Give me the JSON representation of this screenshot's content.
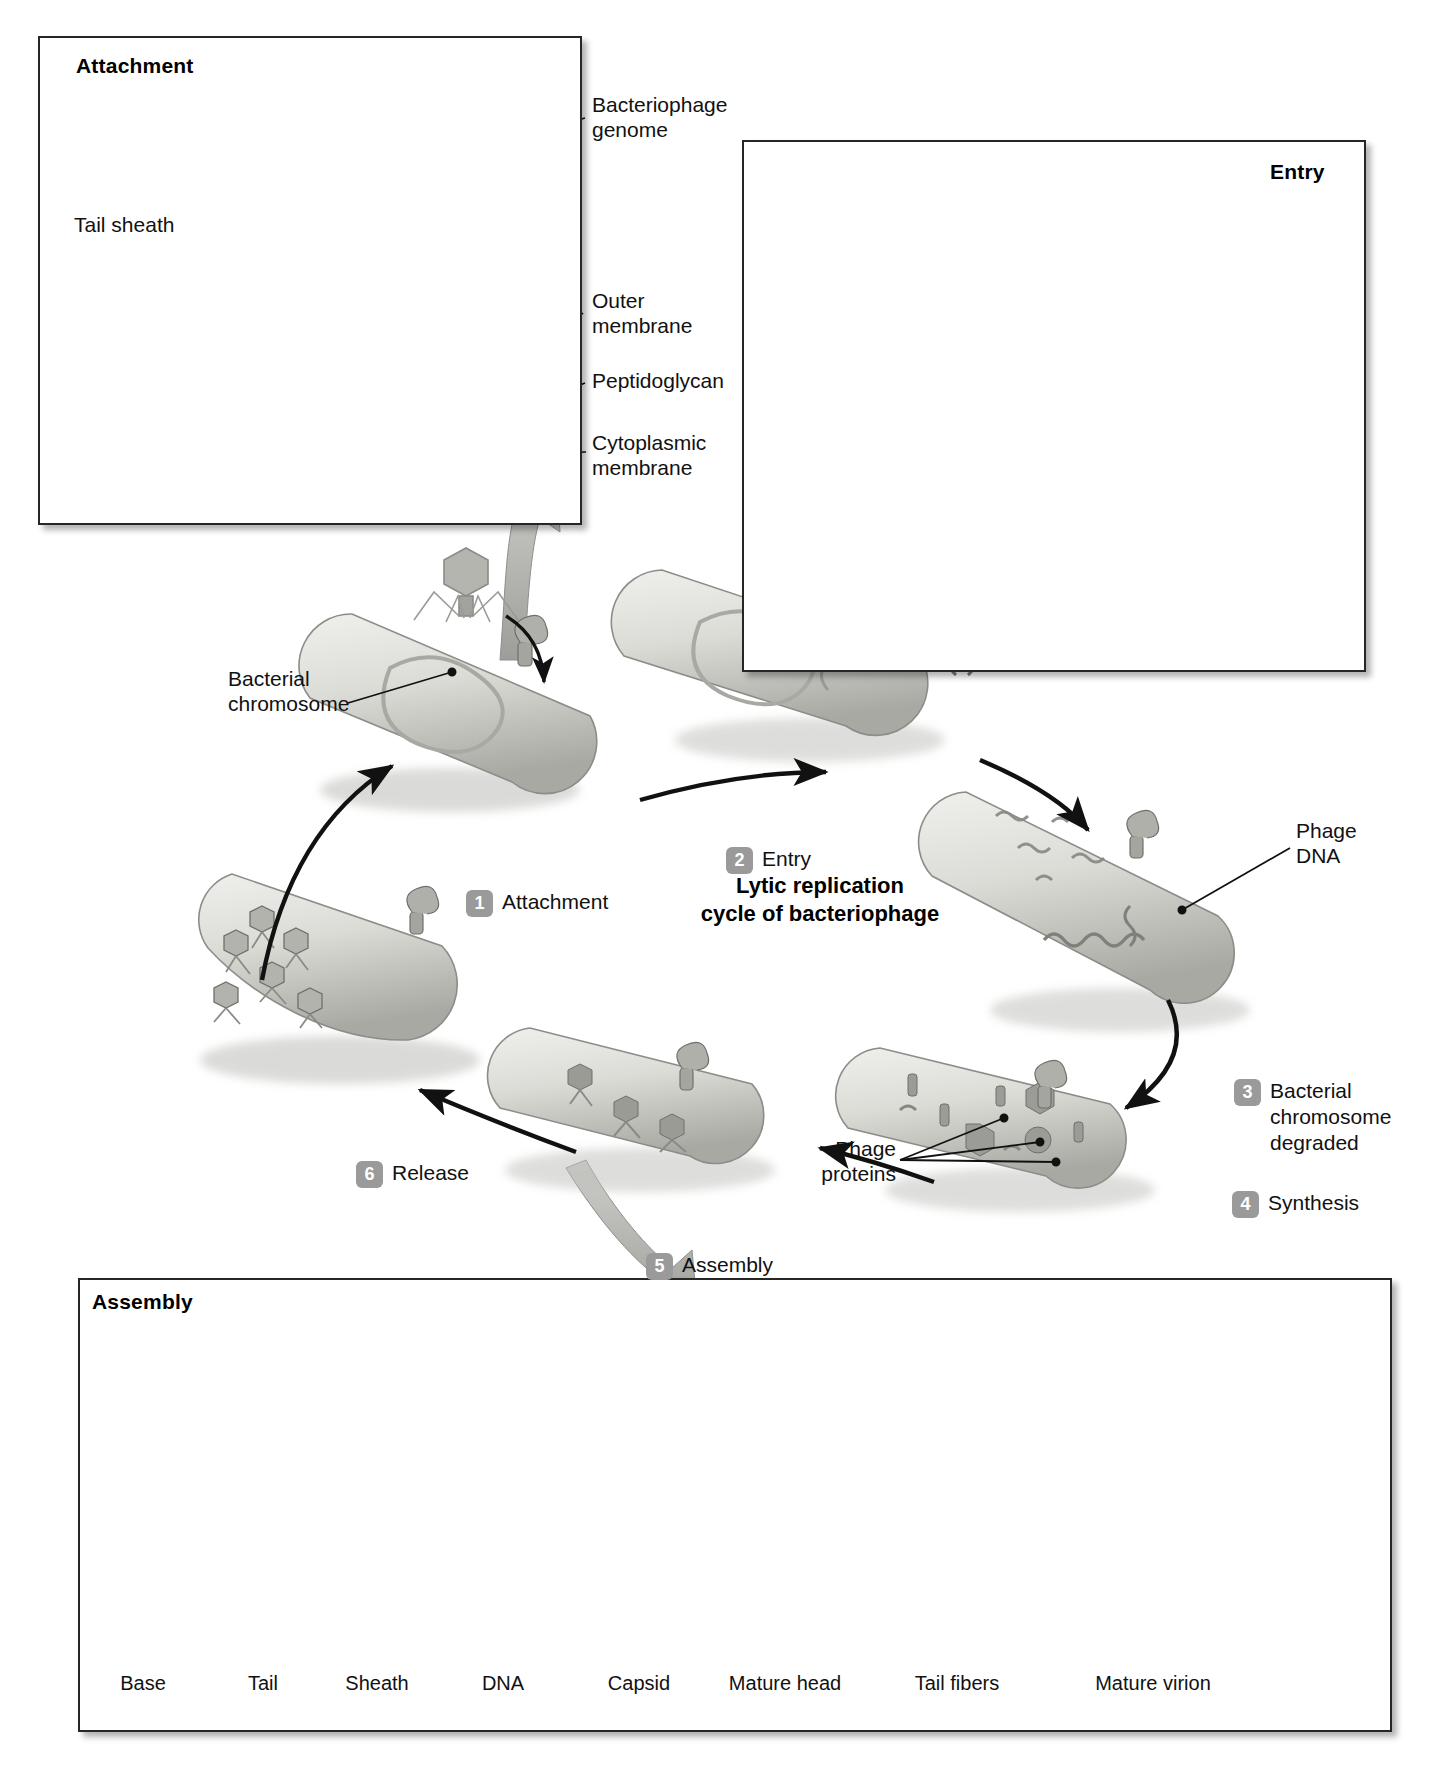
{
  "figure": {
    "center_title": "Lytic replication\ncycle of bacteriophage"
  },
  "panels": {
    "attachment": {
      "title": "Attachment",
      "labels": [
        {
          "id": "bacteriophage-genome",
          "text": "Bacteriophage\ngenome"
        },
        {
          "id": "tail-sheath",
          "text": "Tail sheath"
        },
        {
          "id": "outer-membrane",
          "text": "Outer\nmembrane"
        },
        {
          "id": "peptidoglycan",
          "text": "Peptidoglycan"
        },
        {
          "id": "cytoplasmic-membrane",
          "text": "Cytoplasmic\nmembrane"
        }
      ]
    },
    "entry": {
      "title": "Entry"
    },
    "assembly": {
      "title": "Assembly",
      "stages": [
        {
          "name": "Base"
        },
        {
          "name": "Tail"
        },
        {
          "name": "Sheath"
        },
        {
          "name": "DNA"
        },
        {
          "name": "Capsid"
        },
        {
          "name": "Mature head"
        },
        {
          "name": "Tail fibers"
        },
        {
          "name": "Mature virion"
        }
      ]
    }
  },
  "cycle": {
    "callouts": [
      {
        "id": "bacterial-chromosome",
        "text": "Bacterial\nchromosome"
      },
      {
        "id": "phage-dna",
        "text": "Phage\nDNA"
      },
      {
        "id": "phage-proteins",
        "text": "Phage\nproteins"
      }
    ],
    "steps": [
      {
        "number": "1",
        "label": "Attachment"
      },
      {
        "number": "2",
        "label": "Entry"
      },
      {
        "number": "3",
        "label": "Bacterial\nchromosome\ndegraded"
      },
      {
        "number": "4",
        "label": "Synthesis"
      },
      {
        "number": "5",
        "label": "Assembly"
      },
      {
        "number": "6",
        "label": "Release"
      }
    ]
  },
  "colors": {
    "badge_gray": "#9a9a9a",
    "line_black": "#111111",
    "panel_border": "#262626",
    "arrow_gray": "#b3b3b3",
    "cell_fill": "#d8d8d4"
  }
}
